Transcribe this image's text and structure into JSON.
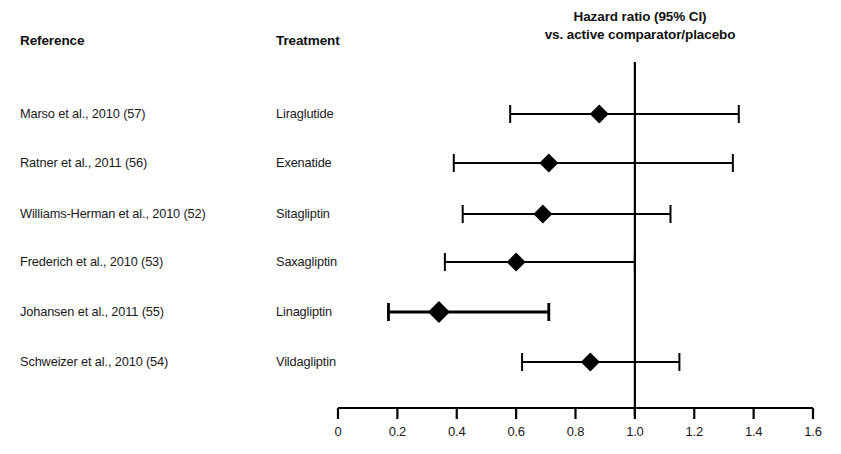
{
  "figure": {
    "background_color": "#ffffff",
    "ink_color": "#000000"
  },
  "columns": {
    "reference_header": "Reference",
    "treatment_header": "Treatment"
  },
  "plot_title": {
    "line1": "Hazard ratio (95% CI)",
    "line2": "vs. active comparator/placebo"
  },
  "rows": [
    {
      "reference": "Marso et al., 2010 (57)",
      "treatment": "Liraglutide"
    },
    {
      "reference": "Ratner et al., 2011 (56)",
      "treatment": "Exenatide"
    },
    {
      "reference": "Williams-Herman et al., 2010 (52)",
      "treatment": "Sitagliptin"
    },
    {
      "reference": "Frederich et al., 2010 (53)",
      "treatment": "Saxagliptin"
    },
    {
      "reference": "Johansen et al., 2011 (55)",
      "treatment": "Linagliptin"
    },
    {
      "reference": "Schweizer et al., 2010 (54)",
      "treatment": "Vildagliptin"
    }
  ],
  "axis": {
    "tick_labels": [
      "0",
      "0.2",
      "0.4",
      "0.6",
      "0.8",
      "1.0",
      "1.2",
      "1.4",
      "1.6"
    ],
    "tick_values": [
      0,
      0.2,
      0.4,
      0.6,
      0.8,
      1.0,
      1.2,
      1.4,
      1.6
    ],
    "min": 0,
    "max": 1.6,
    "reference_line_value": 1.0
  },
  "chart_data": {
    "type": "scatter",
    "subtype": "forest-plot",
    "title": "Hazard ratio (95% CI) vs. active comparator/placebo",
    "xlabel": "",
    "ylabel": "",
    "xlim": [
      0,
      1.6
    ],
    "xticks": [
      0,
      0.2,
      0.4,
      0.6,
      0.8,
      1.0,
      1.2,
      1.4,
      1.6
    ],
    "xticklabels": [
      "0",
      "0.2",
      "0.4",
      "0.6",
      "0.8",
      "1.0",
      "1.2",
      "1.4",
      "1.6"
    ],
    "grid": false,
    "legend": false,
    "reference_line": 1.0,
    "marker": "diamond",
    "marker_color": "#000000",
    "categories": [
      "Marso et al., 2010 (57)",
      "Ratner et al., 2011 (56)",
      "Williams-Herman et al., 2010 (52)",
      "Frederich et al., 2010 (53)",
      "Johansen et al., 2011 (55)",
      "Schweizer et al., 2010 (54)"
    ],
    "points": [
      {
        "reference": "Marso et al., 2010 (57)",
        "treatment": "Liraglutide",
        "hazard_ratio": 0.88,
        "ci_low": 0.58,
        "ci_high": 1.35
      },
      {
        "reference": "Ratner et al., 2011 (56)",
        "treatment": "Exenatide",
        "hazard_ratio": 0.71,
        "ci_low": 0.39,
        "ci_high": 1.33
      },
      {
        "reference": "Williams-Herman et al., 2010 (52)",
        "treatment": "Sitagliptin",
        "hazard_ratio": 0.69,
        "ci_low": 0.42,
        "ci_high": 1.12
      },
      {
        "reference": "Frederich et al., 2010 (53)",
        "treatment": "Saxagliptin",
        "hazard_ratio": 0.6,
        "ci_low": 0.36,
        "ci_high": 1.0
      },
      {
        "reference": "Johansen et al., 2011 (55)",
        "treatment": "Linagliptin",
        "hazard_ratio": 0.34,
        "ci_low": 0.17,
        "ci_high": 0.71
      },
      {
        "reference": "Schweizer et al., 2010 (54)",
        "treatment": "Vildagliptin",
        "hazard_ratio": 0.85,
        "ci_low": 0.62,
        "ci_high": 1.15
      }
    ],
    "values": [
      0.88,
      0.71,
      0.69,
      0.6,
      0.34,
      0.85
    ]
  }
}
